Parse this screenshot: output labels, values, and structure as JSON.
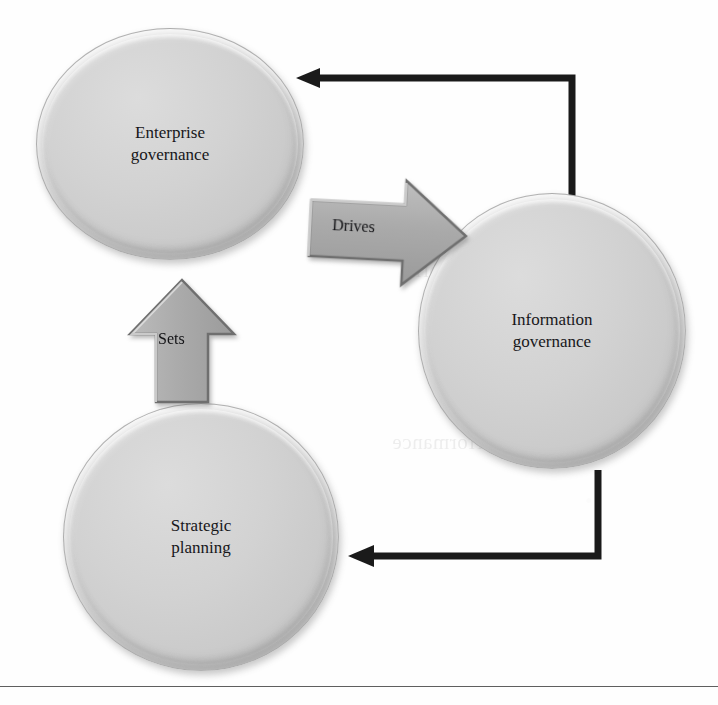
{
  "figure": {
    "type": "cycle-diagram",
    "background_color": "#fefefe",
    "node_fill_color": "#d2d2d2",
    "arrow_color": "#1a1a1a",
    "block_arrow_fill": "#a8a8a8",
    "text_color": "#17171a"
  },
  "nodes": [
    {
      "id": "enterprise-governance",
      "label": "Enterprise\ngovernance",
      "shape": "ellipse",
      "position": "top-left"
    },
    {
      "id": "information-governance",
      "label": "Information\ngovernance",
      "shape": "circle",
      "position": "right"
    },
    {
      "id": "strategic-planning",
      "label": "Strategic\nplanning",
      "shape": "circle",
      "position": "bottom-left"
    }
  ],
  "block_arrows": [
    {
      "id": "drives",
      "label": "Drives",
      "from": "enterprise-governance",
      "to": "information-governance",
      "direction": "right"
    },
    {
      "id": "sets",
      "label": "Sets",
      "from": "strategic-planning",
      "to": "enterprise-governance",
      "direction": "up"
    }
  ],
  "connectors": [
    {
      "id": "information-to-enterprise",
      "label": "",
      "from": "information-governance",
      "to": "enterprise-governance",
      "style": "elbow-up-left",
      "arrowhead": "left"
    },
    {
      "id": "information-to-strategic",
      "label": "",
      "from": "information-governance",
      "to": "strategic-planning",
      "style": "elbow-down-left",
      "arrowhead": "left"
    }
  ],
  "ghost_text": {
    "lines": [
      "and governance",
      "mandated set of prin",
      "ples. Clearly, infor",
      "Review performance",
      "dels by introd"
    ]
  },
  "footer": {
    "rule_visible": "true"
  }
}
